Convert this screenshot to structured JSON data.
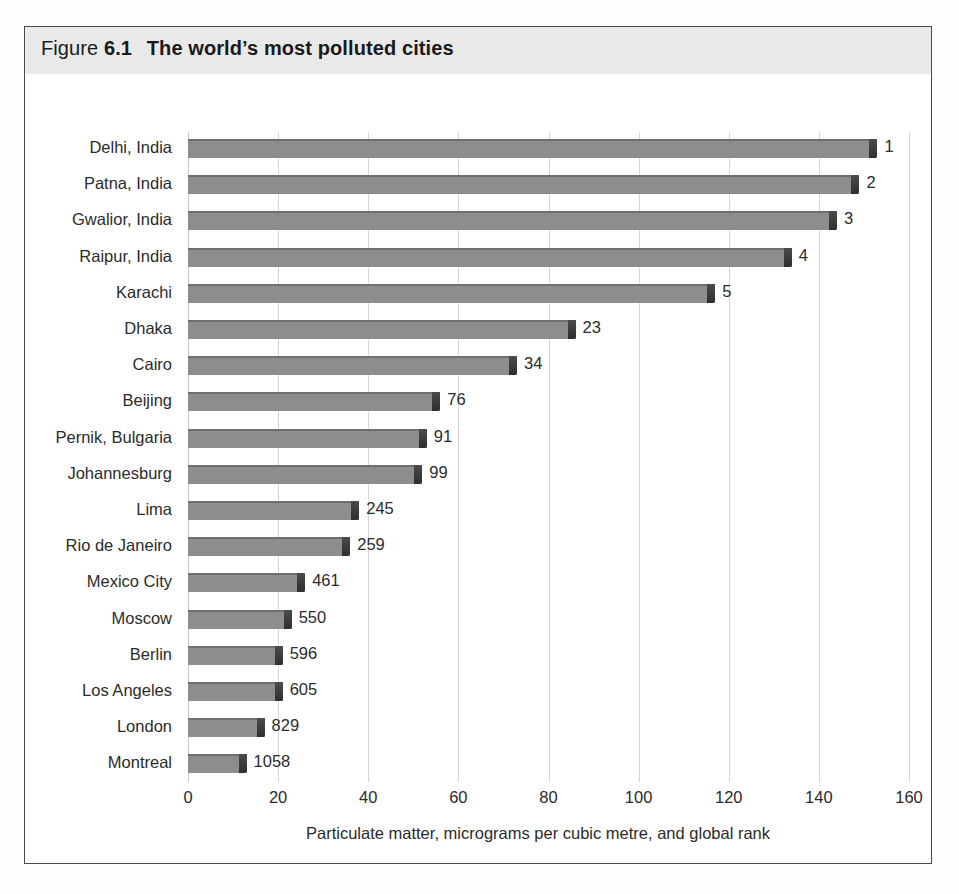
{
  "figure": {
    "label_word": "Figure",
    "number": "6.1",
    "title": "The world’s most polluted cities",
    "band_color": "#e9e9e9",
    "border_color": "#4a4a4a"
  },
  "style": {
    "bar_color": "#8d8d8d",
    "bar_top_edge_color": "#6f6f6f",
    "bar_cap_color": "#3a3a3a",
    "gridline_color": "#d6d6d6",
    "text_color": "#2b2b2b"
  },
  "chart_data": {
    "type": "bar",
    "orientation": "horizontal",
    "title": "The world’s most polluted cities",
    "xlabel": "Particulate matter, micrograms per cubic metre, and global rank",
    "ylabel": "",
    "xlim": [
      0,
      160
    ],
    "xticks": [
      0,
      20,
      40,
      60,
      80,
      100,
      120,
      140,
      160
    ],
    "grid": "vertical",
    "legend": "none",
    "categories": [
      "Delhi, India",
      "Patna, India",
      "Gwalior, India",
      "Raipur, India",
      "Karachi",
      "Dhaka",
      "Cairo",
      "Beijing",
      "Pernik, Bulgaria",
      "Johannesburg",
      "Lima",
      "Rio de Janeiro",
      "Mexico City",
      "Moscow",
      "Berlin",
      "Los Angeles",
      "London",
      "Montreal"
    ],
    "values": [
      153,
      149,
      144,
      134,
      117,
      86,
      73,
      56,
      53,
      52,
      38,
      36,
      26,
      23,
      21,
      21,
      17,
      13
    ],
    "point_labels": [
      "1",
      "2",
      "3",
      "4",
      "5",
      "23",
      "34",
      "76",
      "91",
      "99",
      "245",
      "259",
      "461",
      "550",
      "596",
      "605",
      "829",
      "1058"
    ],
    "point_label_meaning": "global rank"
  }
}
